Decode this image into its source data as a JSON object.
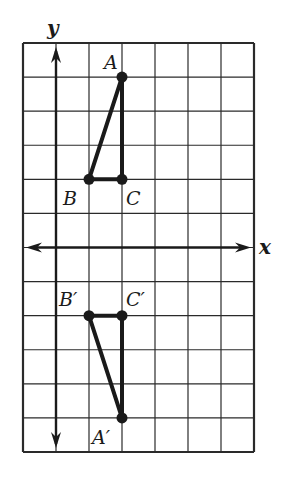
{
  "diagram": {
    "type": "coordinate-grid-reflection",
    "grid": {
      "columns": 7,
      "rows": 12,
      "x_origin_col": 1,
      "y_origin_row": 6,
      "x_range": [
        -1,
        6
      ],
      "y_range": [
        -6,
        6
      ]
    },
    "axes": {
      "x_label": "x",
      "y_label": "y"
    },
    "triangles": [
      {
        "name": "ABC",
        "vertices": [
          {
            "label": "A",
            "x": 2,
            "y": 5
          },
          {
            "label": "B",
            "x": 1,
            "y": 2
          },
          {
            "label": "C",
            "x": 2,
            "y": 2
          }
        ]
      },
      {
        "name": "A'B'C'",
        "vertices": [
          {
            "label": "A′",
            "x": 2,
            "y": -5
          },
          {
            "label": "B′",
            "x": 1,
            "y": -2
          },
          {
            "label": "C′",
            "x": 2,
            "y": -2
          }
        ]
      }
    ],
    "colors": {
      "grid": "#2a2a2a",
      "shape": "#1a1a1a",
      "background": "#ffffff"
    }
  }
}
